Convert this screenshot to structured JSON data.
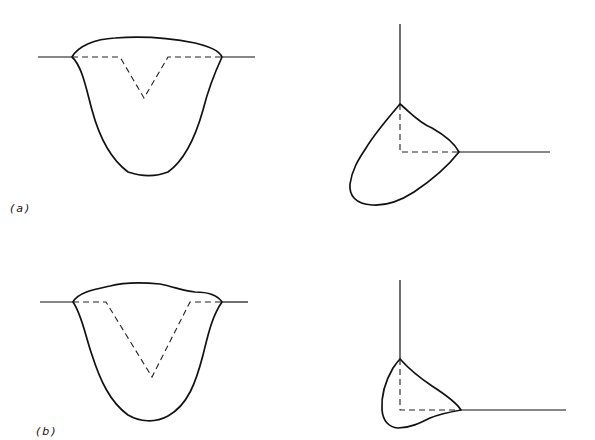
{
  "figure": {
    "panels": [
      {
        "id": "a",
        "label": "(a)",
        "description": "Shallow groove butt weld and fillet weld cross-sections"
      },
      {
        "id": "b",
        "label": "(b)",
        "description": "Deep V groove butt weld and fillet weld cross-sections"
      }
    ],
    "colors": {
      "line": "#111111",
      "background": "#ffffff"
    }
  }
}
